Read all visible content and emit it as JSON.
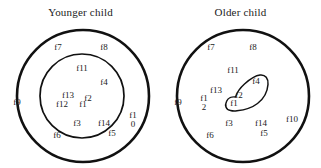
{
  "figure": {
    "type": "diagram"
  },
  "panels": [
    {
      "id": "younger",
      "title": "Younger child",
      "circles": [
        {
          "name": "outer-circle",
          "cx": 83,
          "cy": 96,
          "r": 66
        },
        {
          "name": "inner-circle",
          "cx": 82,
          "cy": 96,
          "r": 42
        }
      ],
      "blob": null,
      "labels": [
        {
          "text": "f7",
          "x": 58,
          "y": 48,
          "wrap": false
        },
        {
          "text": "f8",
          "x": 104,
          "y": 48,
          "wrap": false
        },
        {
          "text": "f9",
          "x": 17,
          "y": 103,
          "wrap": false
        },
        {
          "text": "f10",
          "x": 133,
          "y": 120,
          "wrap": true
        },
        {
          "text": "f6",
          "x": 57,
          "y": 136,
          "wrap": false
        },
        {
          "text": "f5",
          "x": 112,
          "y": 134,
          "wrap": false
        },
        {
          "text": "f11",
          "x": 82,
          "y": 69,
          "wrap": false
        },
        {
          "text": "f4",
          "x": 104,
          "y": 83,
          "wrap": false
        },
        {
          "text": "f13",
          "x": 68,
          "y": 96,
          "wrap": false
        },
        {
          "text": "f12",
          "x": 62,
          "y": 105,
          "wrap": false
        },
        {
          "text": "f1",
          "x": 83,
          "y": 105,
          "wrap": false
        },
        {
          "text": "f2",
          "x": 88,
          "y": 99,
          "wrap": false
        },
        {
          "text": "f3",
          "x": 77,
          "y": 124,
          "wrap": false
        },
        {
          "text": "f14",
          "x": 104,
          "y": 124,
          "wrap": false
        }
      ]
    },
    {
      "id": "older",
      "title": "Older child",
      "circles": [
        {
          "name": "outer-circle",
          "cx": 83,
          "cy": 96,
          "r": 66
        }
      ],
      "blob": {
        "name": "feature-cluster-blob"
      },
      "labels": [
        {
          "text": "f7",
          "x": 51,
          "y": 48,
          "wrap": false
        },
        {
          "text": "f8",
          "x": 93,
          "y": 48,
          "wrap": false
        },
        {
          "text": "f9",
          "x": 18,
          "y": 103,
          "wrap": false
        },
        {
          "text": "f10",
          "x": 132,
          "y": 120,
          "wrap": false
        },
        {
          "text": "f6",
          "x": 50,
          "y": 136,
          "wrap": false
        },
        {
          "text": "f5",
          "x": 104,
          "y": 134,
          "wrap": false
        },
        {
          "text": "f11",
          "x": 73,
          "y": 71,
          "wrap": false
        },
        {
          "text": "f13",
          "x": 56,
          "y": 91,
          "wrap": false
        },
        {
          "text": "f12",
          "x": 44,
          "y": 103,
          "wrap": true
        },
        {
          "text": "f4",
          "x": 96,
          "y": 82,
          "wrap": false
        },
        {
          "text": "f2",
          "x": 79,
          "y": 96,
          "wrap": false
        },
        {
          "text": "f1",
          "x": 74,
          "y": 104,
          "wrap": false
        },
        {
          "text": "f3",
          "x": 69,
          "y": 124,
          "wrap": false
        },
        {
          "text": "f14",
          "x": 101,
          "y": 124,
          "wrap": false
        }
      ]
    }
  ],
  "style": {
    "stroke_color": "#111111",
    "background": "#ffffff"
  }
}
